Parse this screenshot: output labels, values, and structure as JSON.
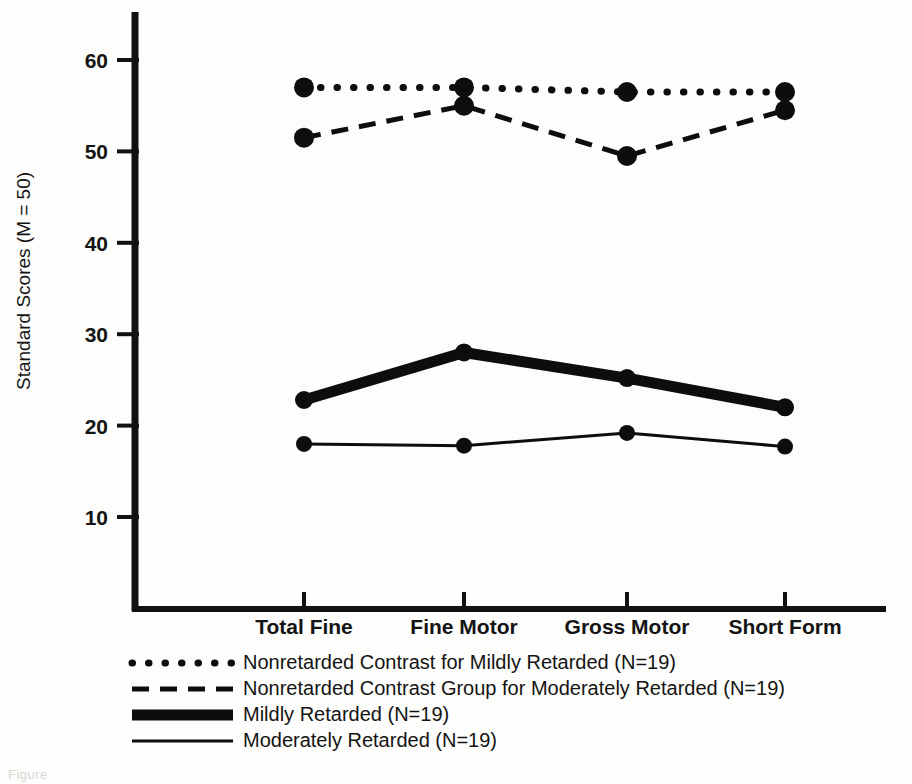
{
  "figure": {
    "background_color": "#fdfdfb",
    "ink_color": "#0d0d0d",
    "caption_fragment": "Figure"
  },
  "axes": {
    "y_title": "Standard Scores (M = 50)",
    "y_ticks": [
      "60",
      "50",
      "40",
      "30",
      "20",
      "10"
    ],
    "x_categories": [
      "Total Fine",
      "Fine Motor",
      "Gross Motor",
      "Short Form"
    ]
  },
  "legend": {
    "items": [
      {
        "style": "dotted",
        "label": "Nonretarded Contrast for Mildly Retarded (N=19)"
      },
      {
        "style": "dashed",
        "label": "Nonretarded Contrast Group for Moderately Retarded (N=19)"
      },
      {
        "style": "thick-solid",
        "label": "Mildly Retarded (N=19)"
      },
      {
        "style": "thin-solid",
        "label": "Moderately Retarded (N=19)"
      }
    ]
  },
  "chart_data": {
    "type": "line",
    "title": "",
    "xlabel": "",
    "ylabel": "Standard Scores (M = 50)",
    "categories": [
      "Total Fine",
      "Fine Motor",
      "Gross Motor",
      "Short Form"
    ],
    "ylim": [
      5,
      65
    ],
    "yticks": [
      10,
      20,
      30,
      40,
      50,
      60
    ],
    "grid": false,
    "legend_position": "below-axes",
    "series": [
      {
        "name": "Nonretarded Contrast for Mildly Retarded (N=19)",
        "n": 19,
        "style": "dotted",
        "values": [
          57.0,
          57.0,
          56.5,
          56.5
        ]
      },
      {
        "name": "Nonretarded Contrast Group for Moderately Retarded (N=19)",
        "n": 19,
        "style": "dashed",
        "values": [
          51.5,
          55.0,
          49.5,
          54.5
        ]
      },
      {
        "name": "Mildly Retarded (N=19)",
        "n": 19,
        "style": "thick-solid",
        "values": [
          22.8,
          28.0,
          25.2,
          22.0
        ]
      },
      {
        "name": "Moderately Retarded (N=19)",
        "n": 19,
        "style": "thin-solid",
        "values": [
          18.0,
          17.8,
          19.2,
          17.7
        ]
      }
    ]
  }
}
